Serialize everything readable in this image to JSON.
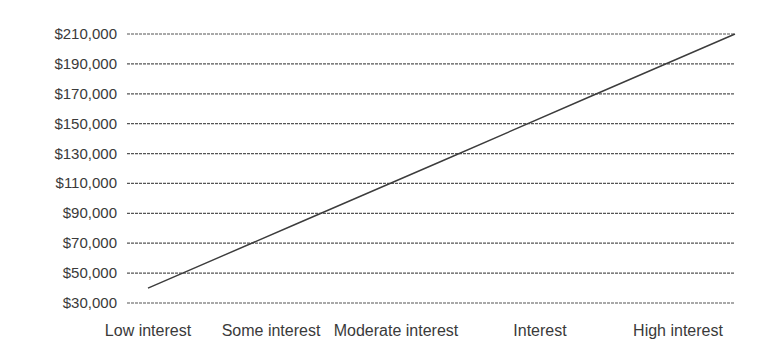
{
  "chart_data": {
    "type": "line",
    "title": "",
    "xlabel": "",
    "ylabel": "",
    "categories": [
      "Low interest",
      "Some interest",
      "Moderate interest",
      "Interest",
      "High interest"
    ],
    "series": [
      {
        "name": "Value",
        "values": [
          40000,
          82500,
          125000,
          167500,
          210000
        ]
      }
    ],
    "y_ticks": [
      30000,
      50000,
      70000,
      90000,
      110000,
      130000,
      150000,
      170000,
      190000,
      210000
    ],
    "y_tick_labels": [
      "$30,000",
      "$50,000",
      "$70,000",
      "$90,000",
      "$110,000",
      "$130,000",
      "$150,000",
      "$170,000",
      "$190,000",
      "$210,000"
    ],
    "ylim": [
      30000,
      210000
    ],
    "grid": {
      "horizontal": true,
      "style": "dashed"
    },
    "legend": null
  },
  "colors": {
    "line": "#3c3c3c",
    "grid": "#555555",
    "text": "#3a3a3a"
  }
}
